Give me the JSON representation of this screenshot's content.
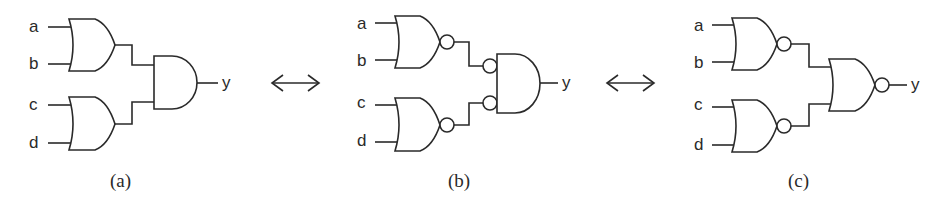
{
  "diagram": {
    "stroke_color": "#2a2a2a",
    "circuits": [
      {
        "caption": "(a)",
        "inputs": [
          "a",
          "b",
          "c",
          "d"
        ],
        "output": "y",
        "first_stage": [
          "OR",
          "OR"
        ],
        "second_stage": "AND",
        "description": "Two OR gates (a,b) and (c,d) feeding an AND gate"
      },
      {
        "caption": "(b)",
        "inputs": [
          "a",
          "b",
          "c",
          "d"
        ],
        "output": "y",
        "first_stage": [
          "NOR",
          "NOR"
        ],
        "second_stage": "AND with inverted inputs",
        "description": "Two NOR gates feeding an AND gate with input bubbles"
      },
      {
        "caption": "(c)",
        "inputs": [
          "a",
          "b",
          "c",
          "d"
        ],
        "output": "y",
        "first_stage": [
          "NAND-shaped NOR",
          "NAND-shaped NOR"
        ],
        "second_stage": "NOR",
        "description": "Two NOR gates feeding a NOR gate"
      }
    ],
    "equivalence_symbols": [
      "⟷",
      "⟷"
    ]
  }
}
